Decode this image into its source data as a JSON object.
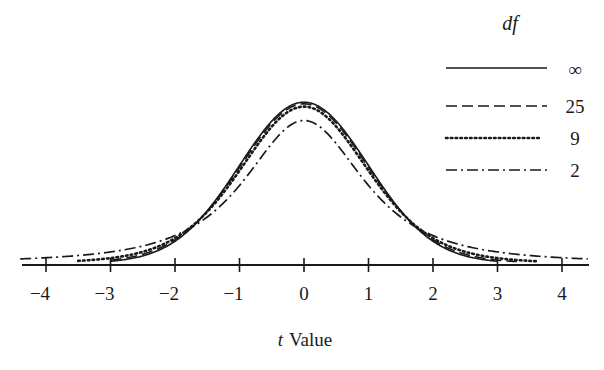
{
  "chart_data": {
    "type": "line",
    "title": "",
    "xlabel_italic": "t",
    "xlabel_rest": "Value",
    "xlabel": "t Value",
    "ylabel": "",
    "xlim": [
      -4.4,
      4.4
    ],
    "x_ticks": [
      -4,
      -3,
      -2,
      -1,
      0,
      1,
      2,
      3,
      4
    ],
    "x_tick_labels": [
      "−4",
      "−3",
      "−2",
      "−1",
      "0",
      "1",
      "2",
      "3",
      "4"
    ],
    "grid": false,
    "legend_position": "upper right",
    "legend_title": "df",
    "series": [
      {
        "name": "∞",
        "df": "inf",
        "style": "solid",
        "x_range": [
          -3.0,
          3.0
        ],
        "peak_density": 0.3989
      },
      {
        "name": "25",
        "df": 25,
        "style": "dashed",
        "x_range": [
          -3.0,
          3.3
        ],
        "peak_density": 0.394
      },
      {
        "name": "9",
        "df": 9,
        "style": "dotted",
        "x_range": [
          -3.5,
          3.6
        ],
        "peak_density": 0.388
      },
      {
        "name": "2",
        "df": 2,
        "style": "dashdot",
        "x_range": [
          -4.4,
          4.4
        ],
        "peak_density": 0.3536
      }
    ]
  },
  "colors": {
    "ink": "#1a1a1a",
    "background": "#ffffff"
  }
}
